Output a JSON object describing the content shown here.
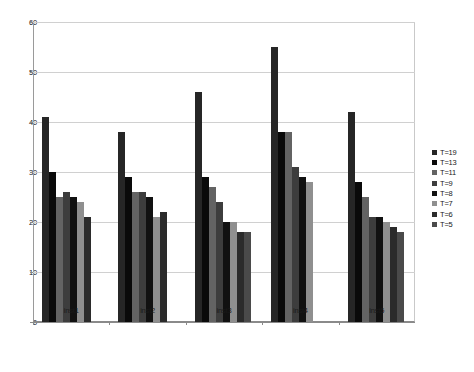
{
  "chart_data": {
    "type": "bar",
    "title": "",
    "subtitle": "",
    "xlabel": "",
    "ylabel": "",
    "categories": [
      "inst1",
      "inst2",
      "inst3",
      "inst4",
      "inst5"
    ],
    "ylim": [
      0,
      60
    ],
    "yticks": [
      0,
      10,
      20,
      30,
      40,
      50,
      60
    ],
    "ytick_labels": [
      "0",
      "10",
      "20",
      "30",
      "40",
      "50",
      "60"
    ],
    "grid": true,
    "legend_position": "right",
    "series": [
      {
        "name": "T=19",
        "color": "#262626",
        "values": [
          41,
          38,
          46,
          55,
          42
        ]
      },
      {
        "name": "T=13",
        "color": "#0a0a0a",
        "values": [
          30,
          29,
          29,
          38,
          28
        ]
      },
      {
        "name": "T=11",
        "color": "#636363",
        "values": [
          25,
          26,
          27,
          38,
          25
        ]
      },
      {
        "name": "T=9",
        "color": "#3d3d3d",
        "values": [
          26,
          26,
          24,
          31,
          21
        ]
      },
      {
        "name": "T=8",
        "color": "#111111",
        "values": [
          25,
          25,
          20,
          29,
          21
        ]
      },
      {
        "name": "T=7",
        "color": "#8f8f8f",
        "values": [
          24,
          21,
          20,
          28,
          20
        ]
      },
      {
        "name": "T=6",
        "color": "#2b2b2b",
        "values": [
          21,
          22,
          18,
          null,
          19
        ]
      },
      {
        "name": "T=5",
        "color": "#4a4a4a",
        "values": [
          null,
          null,
          18,
          null,
          18
        ]
      }
    ]
  }
}
